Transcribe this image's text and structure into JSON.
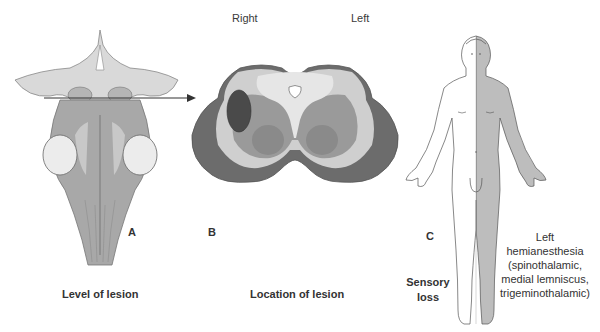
{
  "panels": {
    "a": {
      "letter": "A",
      "caption": "Level of lesion",
      "illustration": "dorsal-brainstem-view"
    },
    "b": {
      "letter": "B",
      "caption": "Location of lesion",
      "side_labels": {
        "right": "Right",
        "left": "Left"
      },
      "illustration": "midbrain-cross-section"
    },
    "c": {
      "letter": "C",
      "side_caption_line1": "Sensory",
      "side_caption_line2": "loss",
      "deficit_lines": [
        "Left",
        "hemianesthesia",
        "(spinothalamic,",
        "medial lemniscus,",
        "trigeminothalamic)"
      ],
      "illustration": "human-body-anterior"
    }
  },
  "colors": {
    "lesion": "#4a4a4a",
    "affected_side": "#b8b8b8",
    "tissue_dark": "#6e6e6e",
    "tissue_light": "#d8d8d8",
    "arrow": "#333333"
  }
}
